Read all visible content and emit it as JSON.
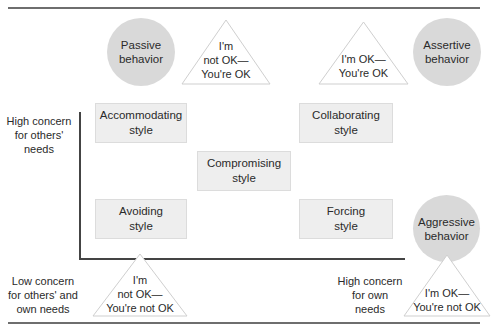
{
  "diagram": {
    "type": "conflict-styles-matrix",
    "behaviors": {
      "passive": "Passive behavior",
      "assertive": "Assertive behavior",
      "aggressive": "Aggressive behavior"
    },
    "positions": {
      "top_left": [
        "I'm",
        "not OK—",
        "You're OK"
      ],
      "top_right": [
        "I'm OK—",
        "You're OK"
      ],
      "bottom_left": [
        "I'm",
        "not OK—",
        "You're not OK"
      ],
      "bottom_right": [
        "I'm OK—",
        "You're not OK"
      ]
    },
    "styles": {
      "accommodating": [
        "Accommodating",
        "style"
      ],
      "collaborating": [
        "Collaborating",
        "style"
      ],
      "compromising": [
        "Compromising",
        "style"
      ],
      "avoiding": [
        "Avoiding",
        "style"
      ],
      "forcing": [
        "Forcing",
        "style"
      ]
    },
    "axis_labels": {
      "y_high": [
        "High concern",
        "for others'",
        "needs"
      ],
      "origin": [
        "Low concern",
        "for others' and",
        "own needs"
      ],
      "x_high": [
        "High concern",
        "for own",
        "needs"
      ]
    },
    "colors": {
      "circle_fill": "#d9d9d9",
      "box_fill": "#eeeeee",
      "rule": "#6e6e6e",
      "axis": "#444444"
    }
  }
}
